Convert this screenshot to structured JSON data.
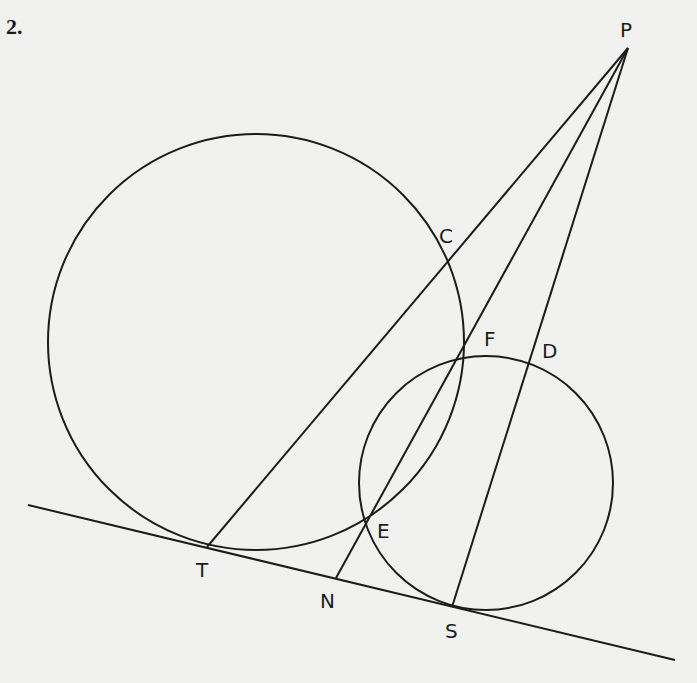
{
  "problem_number": "2.",
  "colors": {
    "background": "#f1f1ef",
    "ink": "#1c1c1c"
  },
  "figure": {
    "type": "geometry",
    "circles": [
      {
        "name": "large-circle",
        "cx": 256,
        "cy": 342,
        "r": 208
      },
      {
        "name": "small-circle",
        "cx": 486,
        "cy": 483,
        "r": 127
      }
    ],
    "tangent_line": {
      "x1": 28,
      "y1": 505,
      "x2": 675,
      "y2": 660
    },
    "points": {
      "P": {
        "x": 628,
        "y": 48
      },
      "C": {
        "x": 445,
        "y": 264
      },
      "F": {
        "x": 459,
        "y": 356
      },
      "D": {
        "x": 531,
        "y": 362
      },
      "E": {
        "x": 368,
        "y": 518
      },
      "T": {
        "x": 207,
        "y": 547
      },
      "N": {
        "x": 336,
        "y": 578
      },
      "S": {
        "x": 452,
        "y": 607
      }
    },
    "segments": [
      {
        "name": "segment-PT",
        "from": "P",
        "to": "T"
      },
      {
        "name": "segment-PN",
        "from": "P",
        "to": "N"
      },
      {
        "name": "segment-PS",
        "from": "P",
        "to": "S"
      }
    ],
    "labels": [
      {
        "text": "P",
        "x": 620,
        "y": 20
      },
      {
        "text": "C",
        "x": 439,
        "y": 226
      },
      {
        "text": "F",
        "x": 484,
        "y": 329
      },
      {
        "text": "D",
        "x": 542,
        "y": 341
      },
      {
        "text": "E",
        "x": 377,
        "y": 521
      },
      {
        "text": "T",
        "x": 196,
        "y": 560
      },
      {
        "text": "N",
        "x": 320,
        "y": 591
      },
      {
        "text": "S",
        "x": 445,
        "y": 621
      }
    ]
  }
}
